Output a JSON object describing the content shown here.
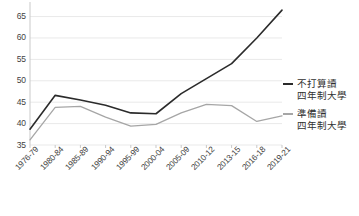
{
  "chart_data": {
    "type": "line",
    "title": "",
    "subtitle": "",
    "xlabel": "",
    "ylabel": "",
    "ylim": [
      35,
      67
    ],
    "yticks": [
      35,
      40,
      45,
      50,
      55,
      60,
      65
    ],
    "ytick_labels": [
      "35",
      "40",
      "45",
      "50",
      "55",
      "60",
      "65"
    ],
    "grid": true,
    "legend_position": "right",
    "categories": [
      "1976-79",
      "1980-84",
      "1985-89",
      "1990-94",
      "1995-99",
      "2000-04",
      "2005-09",
      "2010-12",
      "2013-15",
      "2016-18",
      "2019-21"
    ],
    "series": [
      {
        "name": "不打算讀四年制大學",
        "name_line1": "不打算讀",
        "name_line2": "四年制大學",
        "color": "#2b2b2b",
        "values": [
          38.7,
          46.6,
          45.5,
          44.3,
          42.5,
          42.3,
          47.0,
          50.5,
          54.0,
          60.0,
          66.5
        ]
      },
      {
        "name": "準備讀四年制大學",
        "name_line1": "準備讀",
        "name_line2": "四年制大學",
        "color": "#a6a6a6",
        "values": [
          36.2,
          43.8,
          44.0,
          41.5,
          39.4,
          39.8,
          42.5,
          44.5,
          44.2,
          40.5,
          41.8
        ]
      }
    ]
  },
  "legend": {
    "entries": [
      {
        "line1": "不打算讀",
        "line2": "四年制大學",
        "color": "#2b2b2b"
      },
      {
        "line1": "準備讀",
        "line2": "四年制大學",
        "color": "#a6a6a6"
      }
    ]
  },
  "colors": {
    "grid": "#e9e9e9",
    "axis": "#c9c9c9",
    "text": "#3f3f3f",
    "series_dark": "#2b2b2b",
    "series_light": "#a6a6a6",
    "background": "#ffffff"
  }
}
